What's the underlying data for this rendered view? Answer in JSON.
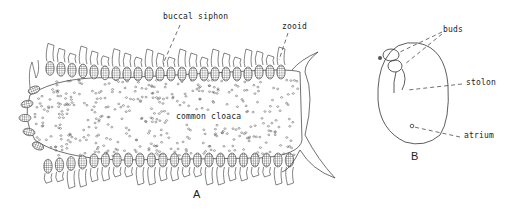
{
  "figure": {
    "panels": [
      {
        "id": "A",
        "label": "A",
        "description": "colony of zooids arranged around a common cloaca",
        "annotations": [
          {
            "text": "buccal siphon"
          },
          {
            "text": "zooid"
          },
          {
            "text": "common cloaca"
          }
        ]
      },
      {
        "id": "B",
        "label": "B",
        "description": "single zooid with buds and stolon",
        "annotations": [
          {
            "text": "buds"
          },
          {
            "text": "stolon"
          },
          {
            "text": "atrium"
          }
        ]
      }
    ],
    "colors": {
      "ink": "#333333",
      "background": "#ffffff"
    }
  }
}
